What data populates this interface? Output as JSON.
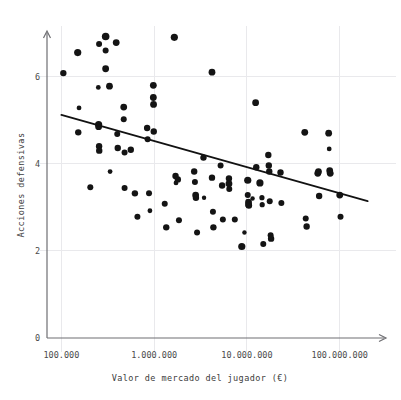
{
  "chart_data": {
    "type": "scatter",
    "title": "",
    "xlabel": "Valor de mercado del jugador (€)",
    "ylabel": "Acciones defensivas",
    "xscale": "log",
    "yscale": "linear",
    "grid": true,
    "legend": "none",
    "xlim": [
      70000,
      300000000
    ],
    "ylim": [
      0,
      7.0
    ],
    "xticks": [
      100000,
      1000000,
      10000000,
      100000000
    ],
    "xticklabels": [
      "100.000",
      "1.000.000",
      "10.000.000",
      "100.000.000"
    ],
    "yticks": [
      0,
      2,
      4,
      6
    ],
    "yticklabels": [
      "0",
      "2",
      "4",
      "6"
    ],
    "marker_color": "#141414",
    "grid_color": "#e9e9ec",
    "axis_color": "#6e6e72",
    "trendline": {
      "color": "#121212",
      "x": [
        100000,
        200000000
      ],
      "y": [
        5.12,
        3.14
      ],
      "description": "negative linear fit on log x"
    },
    "points": [
      {
        "x": 105000,
        "y": 6.08,
        "s": 3.2
      },
      {
        "x": 150000,
        "y": 6.55,
        "s": 3.6
      },
      {
        "x": 155000,
        "y": 5.28,
        "s": 2.4
      },
      {
        "x": 152000,
        "y": 4.72,
        "s": 3.2
      },
      {
        "x": 205000,
        "y": 3.46,
        "s": 3.0
      },
      {
        "x": 255000,
        "y": 6.75,
        "s": 3.0
      },
      {
        "x": 250000,
        "y": 5.75,
        "s": 2.4
      },
      {
        "x": 252000,
        "y": 4.9,
        "s": 3.6
      },
      {
        "x": 252000,
        "y": 4.85,
        "s": 3.4
      },
      {
        "x": 255000,
        "y": 4.4,
        "s": 3.2
      },
      {
        "x": 256000,
        "y": 4.3,
        "s": 3.2
      },
      {
        "x": 300000,
        "y": 6.92,
        "s": 3.8
      },
      {
        "x": 300000,
        "y": 6.6,
        "s": 3.0
      },
      {
        "x": 300000,
        "y": 6.18,
        "s": 3.4
      },
      {
        "x": 330000,
        "y": 5.78,
        "s": 3.4
      },
      {
        "x": 335000,
        "y": 3.82,
        "s": 2.4
      },
      {
        "x": 390000,
        "y": 6.78,
        "s": 3.4
      },
      {
        "x": 400000,
        "y": 4.68,
        "s": 3.0
      },
      {
        "x": 405000,
        "y": 4.36,
        "s": 3.2
      },
      {
        "x": 470000,
        "y": 5.3,
        "s": 3.4
      },
      {
        "x": 470000,
        "y": 5.02,
        "s": 3.0
      },
      {
        "x": 480000,
        "y": 4.26,
        "s": 3.0
      },
      {
        "x": 480000,
        "y": 3.44,
        "s": 3.0
      },
      {
        "x": 560000,
        "y": 4.32,
        "s": 3.2
      },
      {
        "x": 620000,
        "y": 3.32,
        "s": 3.2
      },
      {
        "x": 660000,
        "y": 2.78,
        "s": 3.0
      },
      {
        "x": 840000,
        "y": 4.82,
        "s": 3.2
      },
      {
        "x": 850000,
        "y": 4.56,
        "s": 3.0
      },
      {
        "x": 880000,
        "y": 3.32,
        "s": 3.0
      },
      {
        "x": 900000,
        "y": 2.92,
        "s": 2.4
      },
      {
        "x": 980000,
        "y": 5.8,
        "s": 3.4
      },
      {
        "x": 980000,
        "y": 5.52,
        "s": 3.4
      },
      {
        "x": 985000,
        "y": 5.36,
        "s": 3.4
      },
      {
        "x": 990000,
        "y": 4.74,
        "s": 3.2
      },
      {
        "x": 1300000,
        "y": 3.08,
        "s": 3.0
      },
      {
        "x": 1350000,
        "y": 2.54,
        "s": 3.2
      },
      {
        "x": 1650000,
        "y": 6.9,
        "s": 3.6
      },
      {
        "x": 1700000,
        "y": 3.72,
        "s": 3.2
      },
      {
        "x": 1720000,
        "y": 3.56,
        "s": 2.4
      },
      {
        "x": 1800000,
        "y": 3.64,
        "s": 3.2
      },
      {
        "x": 1850000,
        "y": 2.7,
        "s": 3.0
      },
      {
        "x": 2700000,
        "y": 3.82,
        "s": 3.2
      },
      {
        "x": 2750000,
        "y": 3.58,
        "s": 3.0
      },
      {
        "x": 2800000,
        "y": 3.28,
        "s": 3.4
      },
      {
        "x": 2820000,
        "y": 3.22,
        "s": 3.2
      },
      {
        "x": 2900000,
        "y": 2.42,
        "s": 3.0
      },
      {
        "x": 3400000,
        "y": 4.14,
        "s": 3.2
      },
      {
        "x": 3450000,
        "y": 3.22,
        "s": 2.2
      },
      {
        "x": 4200000,
        "y": 6.1,
        "s": 3.4
      },
      {
        "x": 4200000,
        "y": 3.68,
        "s": 3.2
      },
      {
        "x": 4300000,
        "y": 2.9,
        "s": 3.0
      },
      {
        "x": 4350000,
        "y": 2.54,
        "s": 3.2
      },
      {
        "x": 5200000,
        "y": 3.96,
        "s": 3.0
      },
      {
        "x": 5400000,
        "y": 3.5,
        "s": 3.2
      },
      {
        "x": 5500000,
        "y": 2.72,
        "s": 3.0
      },
      {
        "x": 6400000,
        "y": 3.66,
        "s": 3.2
      },
      {
        "x": 6400000,
        "y": 3.54,
        "s": 3.4
      },
      {
        "x": 6450000,
        "y": 3.42,
        "s": 3.0
      },
      {
        "x": 7400000,
        "y": 2.72,
        "s": 3.0
      },
      {
        "x": 8800000,
        "y": 2.1,
        "s": 3.6
      },
      {
        "x": 9400000,
        "y": 2.42,
        "s": 2.2
      },
      {
        "x": 10200000,
        "y": 3.62,
        "s": 3.6
      },
      {
        "x": 10200000,
        "y": 3.28,
        "s": 3.0
      },
      {
        "x": 10400000,
        "y": 3.12,
        "s": 3.4
      },
      {
        "x": 10400000,
        "y": 3.06,
        "s": 3.4
      },
      {
        "x": 10500000,
        "y": 3.04,
        "s": 3.2
      },
      {
        "x": 11500000,
        "y": 3.2,
        "s": 2.2
      },
      {
        "x": 12400000,
        "y": 5.4,
        "s": 3.4
      },
      {
        "x": 12600000,
        "y": 3.92,
        "s": 3.2
      },
      {
        "x": 13800000,
        "y": 3.56,
        "s": 3.6
      },
      {
        "x": 14500000,
        "y": 3.22,
        "s": 2.6
      },
      {
        "x": 14600000,
        "y": 3.06,
        "s": 2.6
      },
      {
        "x": 15000000,
        "y": 2.16,
        "s": 3.0
      },
      {
        "x": 17000000,
        "y": 4.2,
        "s": 3.2
      },
      {
        "x": 17200000,
        "y": 3.96,
        "s": 3.2
      },
      {
        "x": 17400000,
        "y": 3.82,
        "s": 3.2
      },
      {
        "x": 17600000,
        "y": 3.14,
        "s": 3.0
      },
      {
        "x": 18000000,
        "y": 2.36,
        "s": 3.0
      },
      {
        "x": 18200000,
        "y": 2.28,
        "s": 3.2
      },
      {
        "x": 23000000,
        "y": 3.8,
        "s": 3.2
      },
      {
        "x": 23500000,
        "y": 3.1,
        "s": 3.0
      },
      {
        "x": 42000000,
        "y": 4.72,
        "s": 3.4
      },
      {
        "x": 43000000,
        "y": 2.74,
        "s": 3.0
      },
      {
        "x": 44000000,
        "y": 2.56,
        "s": 3.2
      },
      {
        "x": 58000000,
        "y": 3.78,
        "s": 3.4
      },
      {
        "x": 59000000,
        "y": 3.82,
        "s": 3.4
      },
      {
        "x": 60000000,
        "y": 3.26,
        "s": 3.2
      },
      {
        "x": 76000000,
        "y": 4.7,
        "s": 3.4
      },
      {
        "x": 77000000,
        "y": 4.34,
        "s": 2.4
      },
      {
        "x": 78000000,
        "y": 3.84,
        "s": 3.4
      },
      {
        "x": 79000000,
        "y": 3.78,
        "s": 3.4
      },
      {
        "x": 100000000,
        "y": 3.28,
        "s": 3.4
      },
      {
        "x": 102000000,
        "y": 2.78,
        "s": 3.0
      }
    ]
  }
}
